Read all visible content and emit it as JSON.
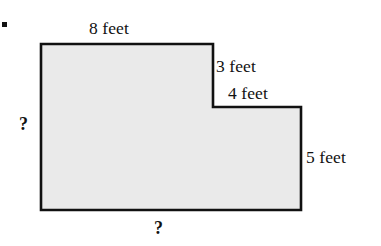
{
  "figure": {
    "kind": "geometry-diagram",
    "shape_name": "notched-rectangle",
    "bullet": "•",
    "fill_color": "#eaeaea",
    "stroke_color": "#111111",
    "stroke_width": 2.6,
    "labels": {
      "top": "8 feet",
      "step_vertical": "3 feet",
      "step_horizontal": "4 feet",
      "right": "5 feet",
      "left_unknown": "?",
      "bottom_unknown": "?"
    },
    "chart_data": {
      "type": "diagram",
      "title": "",
      "shape": "L-shaped polygon (rectangle with top-right notch removed)",
      "units": "feet",
      "vertices_px": [
        [
          41,
          44
        ],
        [
          213,
          44
        ],
        [
          213,
          107
        ],
        [
          301,
          107
        ],
        [
          301,
          210
        ],
        [
          41,
          210
        ]
      ],
      "edges": [
        {
          "name": "top",
          "from": [
            41,
            44
          ],
          "to": [
            213,
            44
          ],
          "label": "8 feet",
          "value": 8,
          "orientation": "horizontal"
        },
        {
          "name": "step-vertical",
          "from": [
            213,
            44
          ],
          "to": [
            213,
            107
          ],
          "label": "3 feet",
          "value": 3,
          "orientation": "vertical"
        },
        {
          "name": "step-horizontal",
          "from": [
            213,
            107
          ],
          "to": [
            301,
            107
          ],
          "label": "4 feet",
          "value": 4,
          "orientation": "horizontal"
        },
        {
          "name": "right",
          "from": [
            301,
            107
          ],
          "to": [
            301,
            210
          ],
          "label": "5 feet",
          "value": 5,
          "orientation": "vertical"
        },
        {
          "name": "bottom",
          "from": [
            301,
            210
          ],
          "to": [
            41,
            210
          ],
          "label": "?",
          "value": null,
          "orientation": "horizontal"
        },
        {
          "name": "left",
          "from": [
            41,
            210
          ],
          "to": [
            41,
            44
          ],
          "label": "?",
          "value": null,
          "orientation": "vertical"
        }
      ],
      "known_values": [
        8,
        3,
        4,
        5
      ],
      "unknown_edges": [
        "left",
        "bottom"
      ],
      "grid": false,
      "legend": null,
      "xlabel": "",
      "ylabel": ""
    }
  }
}
